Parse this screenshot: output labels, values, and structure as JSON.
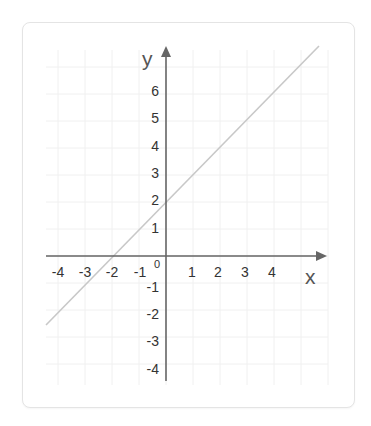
{
  "chart_data": {
    "type": "line",
    "title": "",
    "xlabel": "x",
    "ylabel": "y",
    "xlim": [
      -4,
      4
    ],
    "ylim": [
      -4,
      6
    ],
    "grid": true,
    "legend": null,
    "x_ticks": [
      "-4",
      "-3",
      "-2",
      "-1",
      "1",
      "2",
      "3",
      "4"
    ],
    "y_ticks": [
      "6",
      "5",
      "4",
      "3",
      "2",
      "1",
      "-1",
      "-2",
      "-3",
      "-4"
    ],
    "origin_label": "0",
    "series": [
      {
        "name": "y = x + 2",
        "x": [
          -4.3,
          5.7
        ],
        "y": [
          -2.3,
          7.7
        ],
        "points_of_interest": [
          {
            "x": -2,
            "y": 0,
            "note": "x-intercept"
          },
          {
            "x": 0,
            "y": 2,
            "note": "y-intercept"
          }
        ],
        "color": "#c8c8c8"
      }
    ]
  },
  "colors": {
    "axis": "#666666",
    "grid": "#f0f0f0",
    "line": "#c8c8c8",
    "text": "#333333",
    "card_border": "#e4e4e4"
  }
}
